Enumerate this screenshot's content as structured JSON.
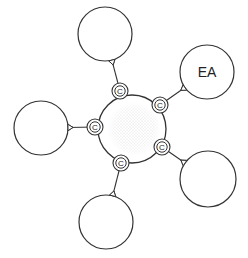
{
  "diagram": {
    "type": "hub-and-spoke",
    "hub": {
      "label": "",
      "fill": "stippled",
      "cx": 132,
      "cy": 129,
      "r": 34
    },
    "connector_label": "C",
    "nodes": [
      {
        "id": "top",
        "label": "",
        "cx": 105,
        "cy": 34,
        "r": 27,
        "conn": [
          120,
          91
        ]
      },
      {
        "id": "upper-right",
        "label": "EA",
        "cx": 207,
        "cy": 72,
        "r": 27,
        "conn": [
          160,
          105
        ]
      },
      {
        "id": "left",
        "label": "",
        "cx": 41,
        "cy": 128,
        "r": 27,
        "conn": [
          95,
          127
        ]
      },
      {
        "id": "lower-right",
        "label": "",
        "cx": 208,
        "cy": 179,
        "r": 28,
        "conn": [
          162,
          147
        ]
      },
      {
        "id": "bottom",
        "label": "",
        "cx": 106,
        "cy": 222,
        "r": 27,
        "conn": [
          121,
          163
        ]
      }
    ],
    "colors": {
      "stroke": "#333333",
      "background": "#ffffff",
      "stipple": "#bbbbbb"
    }
  }
}
